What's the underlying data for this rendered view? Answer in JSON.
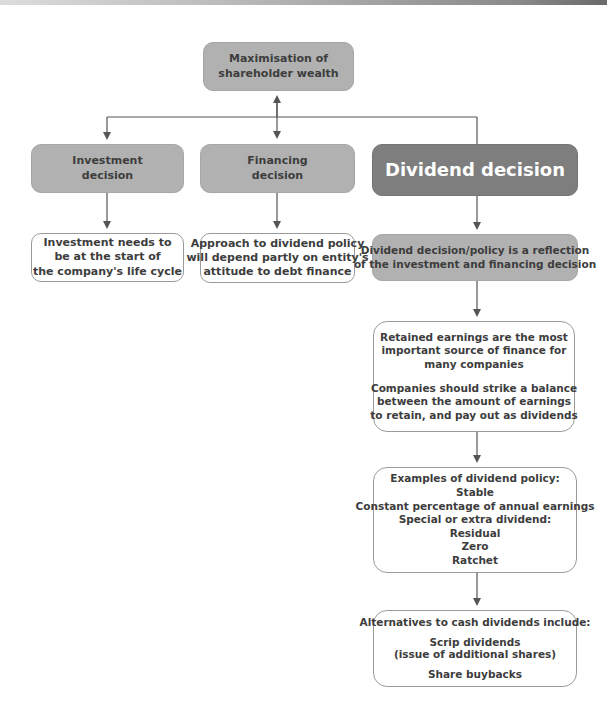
{
  "diagram": {
    "root": {
      "lines": [
        "Maximisation of",
        "shareholder wealth"
      ]
    },
    "decisions": [
      {
        "id": "investment",
        "lines": [
          "Investment",
          "decision"
        ]
      },
      {
        "id": "financing",
        "lines": [
          "Financing",
          "decision"
        ]
      },
      {
        "id": "dividend",
        "lines": [
          "Dividend decision"
        ]
      }
    ],
    "details": {
      "investment": {
        "lines": [
          "Investment needs to",
          "be at the start of",
          "the company's life cycle"
        ]
      },
      "financing": {
        "lines": [
          "Approach to dividend policy",
          "will depend partly on entity's",
          "attitude to debt finance"
        ]
      }
    },
    "dividend_chain": [
      {
        "id": "reflection",
        "lines": [
          "Dividend decision/policy is a reflection",
          "of the investment and financing decision"
        ]
      },
      {
        "id": "retained-earnings",
        "paragraphs": [
          [
            "Retained earnings are the most",
            "important source of finance for",
            "many companies"
          ],
          [
            "Companies should strike a balance",
            "between the amount of earnings",
            "to retain, and pay out as dividends"
          ]
        ]
      },
      {
        "id": "examples",
        "heading": "Examples of dividend policy:",
        "items": [
          "Stable",
          "Constant percentage of annual earnings",
          "Special or extra dividend:",
          "Residual",
          "Zero",
          "Ratchet"
        ]
      },
      {
        "id": "alternatives",
        "heading": "Alternatives to cash dividends include:",
        "groups": [
          [
            "Scrip dividends",
            "(issue of additional shares)"
          ],
          [
            "Share buybacks"
          ]
        ]
      }
    ],
    "colors": {
      "box_grey": "#b1b1b1",
      "box_dark": "#7e7e7e",
      "box_white": "#ffffff",
      "connector": "#555555",
      "text_dark": "#3d3d3d",
      "text_light": "#ffffff"
    }
  }
}
